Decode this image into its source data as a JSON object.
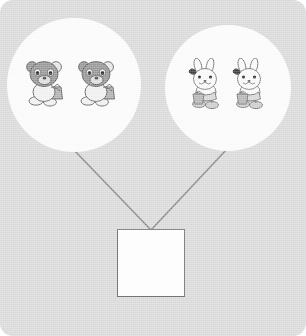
{
  "worksheet": {
    "type": "part-part-whole-addition-diagram",
    "background_color": "#dcdcdc",
    "circle_color": "#fdfdfd",
    "connector_color": "#8a8a8a",
    "box_border_color": "#6e6e6e",
    "box_fill_color": "#ffffff"
  },
  "groups": [
    {
      "id": "left",
      "item_name": "bear",
      "item_label": "teddy bear",
      "count": 2,
      "body_color": "#9a9a9a",
      "outfit_color": "#f2f2f2",
      "items": [
        {
          "label": "bear-1"
        },
        {
          "label": "bear-2"
        }
      ]
    },
    {
      "id": "right",
      "item_name": "rabbit",
      "item_label": "bunny rabbit",
      "count": 2,
      "body_color": "#fbfbfb",
      "outfit_color": "#d9d9d9",
      "items": [
        {
          "label": "rabbit-1"
        },
        {
          "label": "rabbit-2"
        }
      ]
    }
  ],
  "connectors": [
    {
      "from": "left-group",
      "to": "answer-box",
      "x1": 72,
      "y1": 148,
      "x2": 151,
      "y2": 230
    },
    {
      "from": "right-group",
      "to": "answer-box",
      "x1": 228,
      "y1": 148,
      "x2": 151,
      "y2": 230
    }
  ],
  "answer": {
    "value": "",
    "placeholder": ""
  }
}
